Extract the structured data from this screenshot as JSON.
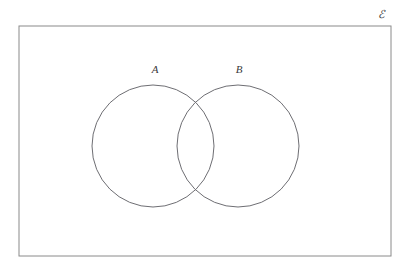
{
  "figure": {
    "type": "venn-diagram",
    "background_color": "#ffffff",
    "stroke_color": "#8a8a8a",
    "text_color": "#3a3a3a",
    "stroke_width": 1
  },
  "universe": {
    "label": "ℰ",
    "label_name": "universal-set-symbol-epsilon",
    "rect": {
      "x": 19,
      "y": 26,
      "width": 372,
      "height": 230
    },
    "label_pos": {
      "x": 381,
      "y": 18
    }
  },
  "sets": [
    {
      "label": "A",
      "name": "set-a",
      "circle": {
        "cx": 153,
        "cy": 146,
        "r": 61
      },
      "label_pos": {
        "x": 155,
        "y": 73
      }
    },
    {
      "label": "B",
      "name": "set-b",
      "circle": {
        "cx": 238,
        "cy": 146,
        "r": 61
      },
      "label_pos": {
        "x": 239,
        "y": 73
      }
    }
  ],
  "chart_data": {
    "type": "diagram",
    "title": "",
    "subtitle": "",
    "xlabel": "",
    "ylabel": "",
    "legend": [],
    "annotations": [
      "ℰ",
      "A",
      "B"
    ],
    "regions": [
      {
        "name": "A only",
        "label": "",
        "shaded": false
      },
      {
        "name": "A intersect B",
        "label": "",
        "shaded": false
      },
      {
        "name": "B only",
        "label": "",
        "shaded": false
      },
      {
        "name": "outside A and B (within universe)",
        "label": "",
        "shaded": false
      }
    ],
    "overlap": true,
    "shaded_regions": [],
    "grid": false
  }
}
